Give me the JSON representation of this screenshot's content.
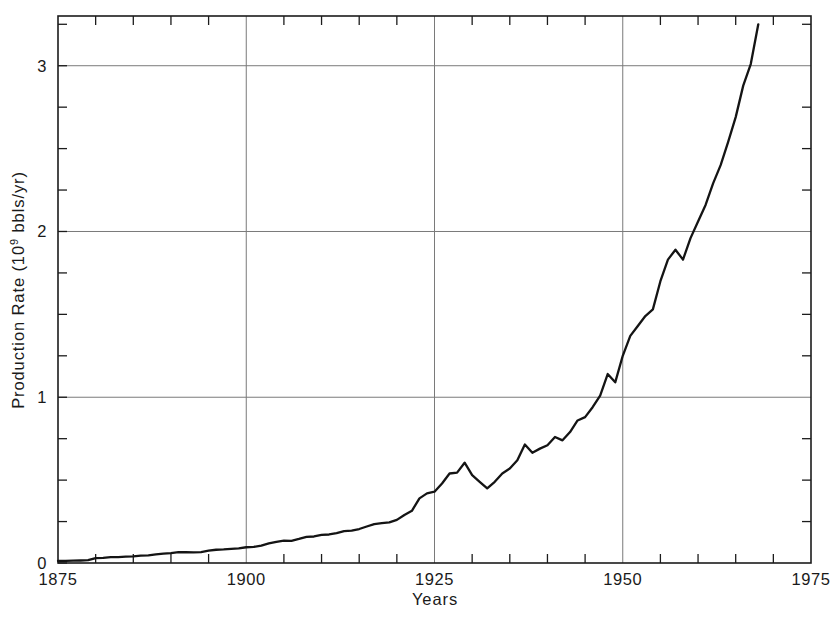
{
  "chart_data": {
    "type": "line",
    "title": "",
    "subtitle": "",
    "xlabel": "Years",
    "ylabel_prefix": "Production Rate  (10",
    "ylabel_exponent": "9",
    "ylabel_suffix": " bbls/yr)",
    "ylabel_full": "Production Rate (10^9 bbls/yr)",
    "xlim": [
      1875,
      1975
    ],
    "ylim": [
      0,
      3.3
    ],
    "x_major_ticks": [
      1875,
      1900,
      1925,
      1950,
      1975
    ],
    "x_major_tick_labels": [
      "1875",
      "1900",
      "1925",
      "1950",
      "1975"
    ],
    "x_minor_tick_step": 5,
    "y_major_ticks": [
      0,
      1,
      2,
      3
    ],
    "y_major_tick_labels": [
      "0",
      "1",
      "2",
      "3"
    ],
    "y_minor_tick_step": 0.25,
    "grid": "major-only",
    "legend": "none",
    "line_color": "#141414",
    "grid_color": "#7a7a7a",
    "axis_color": "#1c1c1c",
    "series": [
      {
        "name": "World crude oil production rate",
        "x": [
          1875,
          1876,
          1877,
          1878,
          1879,
          1880,
          1881,
          1882,
          1883,
          1884,
          1885,
          1886,
          1887,
          1888,
          1889,
          1890,
          1891,
          1892,
          1893,
          1894,
          1895,
          1896,
          1897,
          1898,
          1899,
          1900,
          1901,
          1902,
          1903,
          1904,
          1905,
          1906,
          1907,
          1908,
          1909,
          1910,
          1911,
          1912,
          1913,
          1914,
          1915,
          1916,
          1917,
          1918,
          1919,
          1920,
          1921,
          1922,
          1923,
          1924,
          1925,
          1926,
          1927,
          1928,
          1929,
          1930,
          1931,
          1932,
          1933,
          1934,
          1935,
          1936,
          1937,
          1938,
          1939,
          1940,
          1941,
          1942,
          1943,
          1944,
          1945,
          1946,
          1947,
          1948,
          1949,
          1950,
          1951,
          1952,
          1953,
          1954,
          1955,
          1956,
          1957,
          1958,
          1959,
          1960,
          1961,
          1962,
          1963,
          1964,
          1965,
          1966,
          1967,
          1968
        ],
        "values": [
          0.012,
          0.013,
          0.014,
          0.015,
          0.017,
          0.03,
          0.031,
          0.035,
          0.036,
          0.038,
          0.04,
          0.045,
          0.046,
          0.052,
          0.057,
          0.06,
          0.066,
          0.065,
          0.064,
          0.066,
          0.074,
          0.08,
          0.082,
          0.085,
          0.088,
          0.095,
          0.097,
          0.105,
          0.118,
          0.128,
          0.135,
          0.133,
          0.145,
          0.158,
          0.16,
          0.17,
          0.172,
          0.18,
          0.192,
          0.195,
          0.205,
          0.22,
          0.235,
          0.24,
          0.245,
          0.26,
          0.29,
          0.315,
          0.39,
          0.42,
          0.43,
          0.48,
          0.54,
          0.545,
          0.605,
          0.53,
          0.49,
          0.45,
          0.49,
          0.54,
          0.57,
          0.62,
          0.715,
          0.665,
          0.69,
          0.71,
          0.76,
          0.74,
          0.79,
          0.86,
          0.88,
          0.94,
          1.01,
          1.14,
          1.09,
          1.25,
          1.37,
          1.43,
          1.49,
          1.53,
          1.7,
          1.83,
          1.89,
          1.83,
          1.96,
          2.06,
          2.16,
          2.29,
          2.4,
          2.54,
          2.69,
          2.88,
          3.01,
          3.25
        ]
      }
    ],
    "annotations": [
      {
        "label": "Great Depression dip",
        "x_range": [
          1929,
          1932
        ]
      },
      {
        "label": "Post-war slowdown",
        "x_range": [
          1948,
          1949
        ]
      },
      {
        "label": "1958 recession dip",
        "x_range": [
          1957,
          1958
        ]
      }
    ]
  }
}
